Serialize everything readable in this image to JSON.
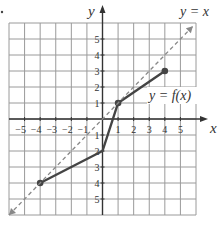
{
  "chart_data": {
    "type": "line",
    "title": "",
    "xlabel": "x",
    "ylabel": "y",
    "xlim": [
      -6,
      6
    ],
    "ylim": [
      -6,
      6
    ],
    "grid": true,
    "x_ticks": [
      -5,
      -4,
      -3,
      -2,
      -1,
      1,
      2,
      3,
      4,
      5
    ],
    "y_ticks": [
      -5,
      -4,
      -3,
      -2,
      -1,
      1,
      2,
      3,
      4,
      5
    ],
    "x_tick_labels": [
      "−5",
      "−4",
      "−3",
      "−2",
      "−1",
      "1",
      "2",
      "3",
      "4",
      "5"
    ],
    "y_tick_labels": [
      "5",
      "4",
      "3",
      "2",
      "1",
      "1",
      "2",
      "3",
      "4",
      "5"
    ],
    "series": [
      {
        "name": "y = f(x)",
        "style": "solid",
        "color": "#444444",
        "points": [
          [
            -4,
            -4
          ],
          [
            0,
            -2
          ],
          [
            1,
            1
          ],
          [
            4,
            3
          ]
        ],
        "markers": [
          [
            -4,
            -4
          ],
          [
            1,
            1
          ],
          [
            4,
            3
          ]
        ]
      },
      {
        "name": "y = x",
        "style": "dashed",
        "color": "#888888",
        "points": [
          [
            -6,
            -6
          ],
          [
            5.8,
            5.8
          ]
        ],
        "arrows": "both"
      }
    ],
    "annotations": [
      {
        "text": "y = f(x)",
        "x": 3.9,
        "y": 1.4
      },
      {
        "text": "y = x",
        "x": 5.7,
        "y": 6.6
      }
    ]
  },
  "labels": {
    "x_axis": "x",
    "y_axis": "y",
    "f_label": "y = f(x)",
    "identity_label": "y = x"
  }
}
